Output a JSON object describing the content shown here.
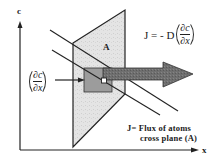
{
  "axes": {
    "y_label": "c",
    "x_label": "x"
  },
  "plane": {
    "label": "A"
  },
  "gradient_term": {
    "numerator": "∂c",
    "denominator": "∂x"
  },
  "equation": {
    "lhs": "J = - D",
    "numerator": "∂c",
    "denominator": "∂x"
  },
  "caption": {
    "line1": "J= Flux  of  atoms",
    "line2": "cross plane (A)"
  },
  "colors": {
    "plane_fill": "#e2e2e2",
    "inner_square": "#9a9a9a",
    "arrow_fill": "#6e6e6e",
    "stroke": "#222222"
  }
}
